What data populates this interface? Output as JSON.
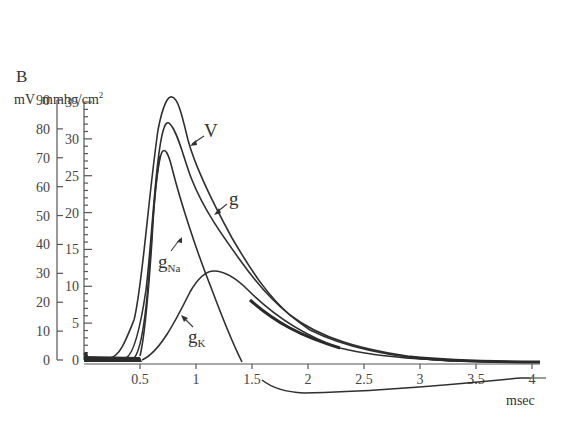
{
  "panel_label": "B",
  "axes": {
    "left_unit": "mV",
    "right_unit": "mmho/cm",
    "right_unit_sup": "2",
    "x_unit": "msec",
    "left_ticks": [
      "0",
      "10",
      "20",
      "30",
      "40",
      "50",
      "60",
      "70",
      "80",
      "90"
    ],
    "right_ticks": [
      "0",
      "5",
      "10",
      "15",
      "20",
      "25",
      "30",
      "35"
    ],
    "x_ticks": [
      "0.5",
      "1",
      "1.5",
      "2",
      "2.5",
      "3",
      "3.5",
      "4"
    ]
  },
  "labels": {
    "V": "V",
    "g": "g",
    "gNa_main": "g",
    "gNa_sub": "Na",
    "gK_main": "g",
    "gK_sub": "K"
  },
  "chart_data": {
    "type": "line",
    "title": "B",
    "xlabel": "msec",
    "ylabel_left": "mV",
    "ylabel_right": "mmho/cm²",
    "xlim": [
      0,
      4
    ],
    "ylim_left": [
      0,
      90
    ],
    "ylim_right": [
      0,
      35
    ],
    "grid": false,
    "legend": "inline arrow labels",
    "x": [
      0,
      0.3,
      0.4,
      0.5,
      0.6,
      0.7,
      0.75,
      0.8,
      0.9,
      1.0,
      1.1,
      1.2,
      1.3,
      1.4,
      1.5,
      2.0,
      2.5,
      3.0,
      3.5,
      4.0
    ],
    "series": [
      {
        "name": "V",
        "axis": "mV",
        "values": [
          0,
          0,
          2,
          12,
          45,
          82,
          90,
          91,
          85,
          74,
          63,
          55,
          47,
          40,
          33,
          14,
          5,
          1,
          0,
          0
        ],
        "note": "dips below zero (undershoot, ~-12 mV) after ~1.5 msec, shown as offset curve returning near 4 msec"
      },
      {
        "name": "g",
        "axis": "mmho/cm²",
        "values": [
          0,
          0,
          0,
          2,
          14,
          29,
          32,
          31,
          27,
          23,
          20,
          17.5,
          15,
          12.5,
          11,
          5,
          2,
          0.7,
          0.3,
          0.2
        ]
      },
      {
        "name": "gNa",
        "axis": "mmho/cm²",
        "values": [
          0,
          0,
          0,
          1,
          12,
          27.5,
          28.4,
          26,
          19,
          12,
          7,
          4,
          1.5,
          0,
          0,
          0,
          0,
          0,
          0,
          0
        ]
      },
      {
        "name": "gK",
        "axis": "mmho/cm²",
        "values": [
          0,
          0,
          0,
          0.2,
          1.5,
          4,
          5.5,
          7,
          9.5,
          11.3,
          12.1,
          11.8,
          11,
          10,
          9,
          5,
          2,
          0.7,
          0.3,
          0.2
        ]
      }
    ],
    "peaks": {
      "V": {
        "t": 0.78,
        "value_mV": 91
      },
      "g": {
        "t": 0.74,
        "value": 32
      },
      "gNa": {
        "t": 0.71,
        "value": 28.4
      },
      "gK": {
        "t": 1.15,
        "value": 12.1
      }
    }
  }
}
